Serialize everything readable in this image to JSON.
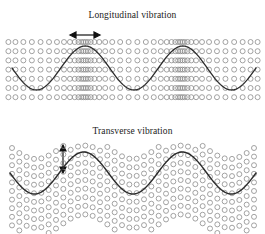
{
  "figure": {
    "background_color": "#ffffff",
    "circle_stroke_color": "#8c8c8c",
    "wave_stroke_color": "#2b2b2b",
    "arrow_color": "#111111",
    "text_color": "#222222",
    "width": 265,
    "height": 234
  },
  "panels": [
    {
      "id": "longitudinal",
      "title": "Longitudinal vibration",
      "arrow": {
        "name": "horizontal-double-arrow",
        "direction": "horizontal",
        "meaning": "particle displacement parallel to wave travel",
        "length": 28
      },
      "lattice": {
        "type": "compression-rarefaction-rows",
        "rows": 7,
        "row_spacing": 9.2,
        "top": 38,
        "circle_radius": 2.5,
        "columns_per_row": 46,
        "x_start": 12,
        "x_end": 254,
        "compression_factor": 0.62
      },
      "wave": {
        "type": "sine",
        "cycles": 2.5,
        "amplitude": 22,
        "baseline": 68,
        "x_start": 12,
        "x_end": 256,
        "phase_deg": 180,
        "stroke_width": 1.3
      }
    },
    {
      "id": "transverse",
      "title": "Transverse vibration",
      "arrow": {
        "name": "vertical-double-arrow",
        "direction": "vertical",
        "meaning": "particle displacement perpendicular to wave travel",
        "length": 26
      },
      "lattice": {
        "type": "displaced-wavy-rows",
        "rows": 10,
        "row_spacing": 8.6,
        "top": 25,
        "circle_radius": 2.5,
        "columns_per_row": 34,
        "x_start": 12,
        "x_end": 254,
        "row_amplitude": 11
      },
      "wave": {
        "type": "sine",
        "cycles": 2.5,
        "amplitude": 21,
        "baseline": 56,
        "x_start": 10,
        "x_end": 256,
        "phase_deg": 180,
        "stroke_width": 1.4
      }
    }
  ],
  "chart_data": {
    "type": "line",
    "xlabel": "",
    "ylabel": "",
    "series": [
      {
        "name": "Longitudinal vibration",
        "waveform": "sine",
        "cycles": 2.5,
        "amplitude": 22,
        "note": "Circle lattice shows alternating compressions and rarefactions aligned with wave crests"
      },
      {
        "name": "Transverse vibration",
        "waveform": "sine",
        "cycles": 2.5,
        "amplitude": 21,
        "note": "Circle lattice rows are displaced perpendicular to the propagation direction"
      }
    ],
    "annotations": [
      "Longitudinal vibration",
      "Transverse vibration"
    ],
    "grid": false,
    "legend_position": "none"
  }
}
